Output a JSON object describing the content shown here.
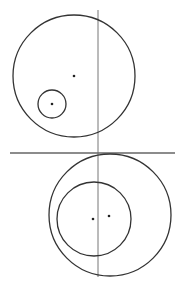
{
  "diagram": {
    "width": 182,
    "height": 287,
    "stroke_color": "#333333",
    "axis_color": "#777777",
    "top_figure": {
      "outer_circle": {
        "cx": 74,
        "cy": 76,
        "r": 61
      },
      "outer_center_dot": {
        "cx": 74,
        "cy": 76
      },
      "inner_circle": {
        "cx": 52,
        "cy": 104,
        "r": 14
      },
      "inner_center_dot": {
        "cx": 52,
        "cy": 104
      }
    },
    "bottom_figure": {
      "outer_circle": {
        "cx": 110,
        "cy": 215,
        "r": 61
      },
      "outer_center_dot": {
        "cx": 109,
        "cy": 216
      },
      "inner_circle": {
        "cx": 94,
        "cy": 219,
        "r": 37
      },
      "inner_center_dot": {
        "cx": 93,
        "cy": 219
      }
    },
    "vertical_line": {
      "x": 98,
      "y1": 10,
      "y2": 277
    },
    "horizontal_line": {
      "y": 153,
      "x1": 10,
      "x2": 175
    }
  }
}
